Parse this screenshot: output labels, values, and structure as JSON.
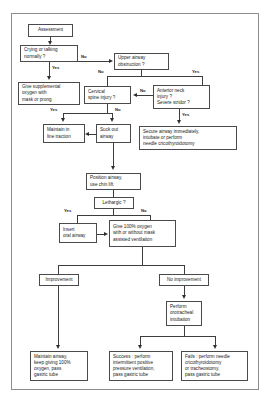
{
  "diagram": {
    "nodes": {
      "assessment": "Assessment",
      "crying": "Crying or talking\nnormally ?",
      "upper_airway": "Upper airway\nobstruction ?",
      "supplemental_oxygen": "Give supplemental\noxygen with\nmask or prong",
      "cervical_spine": "Cervical\nspine injury ?",
      "anterior_neck": "Anterior neck\ninjury ?\nSevere stridor ?",
      "maintain_traction": "Maintain in\nline traction",
      "suck_out_airway": "Suck out\nairway",
      "secure_airway": "Secure airway immediately,\nintubate or perform\nneedle cricothyroidotomy",
      "position_airway": "Position airway,\nuse chin lift",
      "lethargic": "Lethargic ?",
      "insert_oral_airway": "Insert\noral airway",
      "give_oxygen": "Give 100% oxygen\nwith or without mask\nassisted ventilation",
      "improvement": "Improvement",
      "no_improvement": "No improvement",
      "perform_intubation": "Perform\norotracheal\nintubation",
      "maintain_airway": "Maintain airway,\nkeep giving 100%\noxygen, pass\ngastric tube",
      "success": "Success : perform\nintermittent positive\npressure ventilation,\npass gastric tube",
      "fails": "Fails : perform needle\ncricothyroidotomy\nor tracheostomy,\npass gastric tube"
    },
    "edge_labels": {
      "crying_no": "No",
      "crying_yes": "Yes",
      "upper_no": "No",
      "upper_yes": "Yes",
      "anterior_no": "No",
      "anterior_yes": "Yes",
      "cervical_yes": "Yes",
      "cervical_no": "No",
      "lethargic_yes": "Yes",
      "lethargic_no": "No"
    },
    "colors": {
      "border": "#4a4a4a",
      "frame": "#8c8c8c",
      "text": "#1a1a1a",
      "line": "#3d3d3d",
      "background": "#ffffff"
    }
  }
}
